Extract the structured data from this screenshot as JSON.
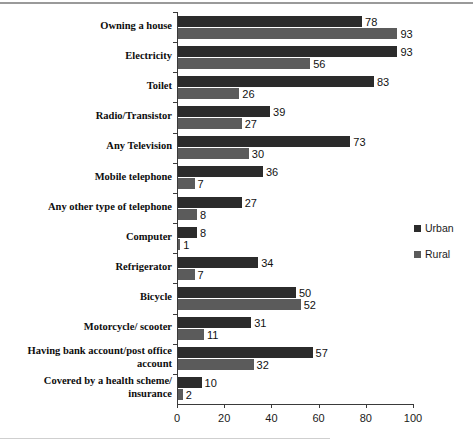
{
  "chart_data": {
    "type": "bar",
    "orientation": "horizontal",
    "title": "",
    "xlabel": "",
    "ylabel": "",
    "xlim": [
      0,
      100
    ],
    "xticks": [
      0,
      20,
      40,
      60,
      80,
      100
    ],
    "grid": false,
    "legend_position": "right",
    "categories": [
      "Owning a house",
      "Electricity",
      "Toilet",
      "Radio/Transistor",
      "Any Television",
      "Mobile telephone",
      "Any other type of telephone",
      "Computer",
      "Refrigerator",
      "Bicycle",
      "Motorcycle/ scooter",
      "Having bank account/post office\naccount",
      "Covered by a health scheme/\ninsurance"
    ],
    "series": [
      {
        "name": "Urban",
        "color": "#2b2b2b",
        "values": [
          78,
          93,
          83,
          39,
          73,
          36,
          27,
          8,
          34,
          50,
          31,
          57,
          10
        ]
      },
      {
        "name": "Rural",
        "color": "#5b5b5b",
        "values": [
          93,
          56,
          26,
          27,
          30,
          7,
          8,
          1,
          7,
          52,
          11,
          32,
          2
        ]
      }
    ]
  },
  "legend": {
    "items": [
      {
        "label": "Urban",
        "color": "#2b2b2b"
      },
      {
        "label": "Rural",
        "color": "#5b5b5b"
      }
    ]
  },
  "axis": {
    "tick_labels": [
      "0",
      "20",
      "40",
      "60",
      "80",
      "100"
    ]
  }
}
